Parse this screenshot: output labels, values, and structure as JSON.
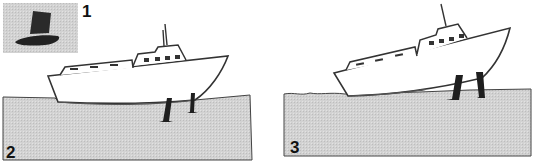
{
  "figure": {
    "panels": [
      {
        "id": "1",
        "label": "1",
        "subject": "hat"
      },
      {
        "id": "2",
        "label": "2",
        "subject": "boat-level-on-stands"
      },
      {
        "id": "3",
        "label": "3",
        "subject": "boat-tilted-on-stands"
      }
    ],
    "colors": {
      "ground": "#cfcfcf",
      "outline": "#333333",
      "stand": "#1e1e1e",
      "hull": "#ffffff"
    }
  }
}
